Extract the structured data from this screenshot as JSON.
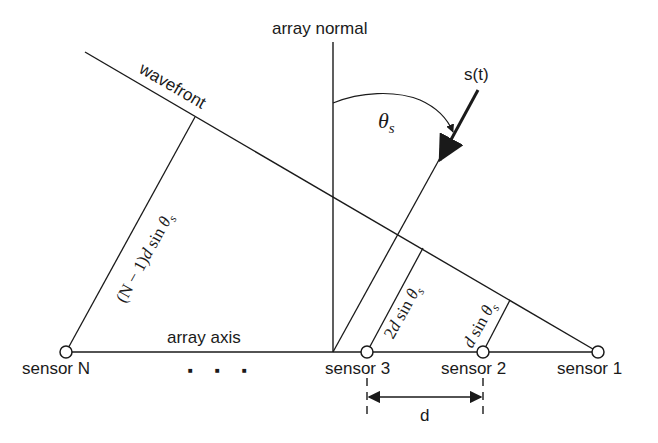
{
  "labels": {
    "array_normal": "array normal",
    "wavefront": "wavefront",
    "signal": "s(t)",
    "theta": "θ",
    "theta_sub": "s",
    "array_axis": "array axis",
    "ellipsis": "■ ■ ■",
    "spacing": "d"
  },
  "sensors": [
    {
      "label": "sensor N",
      "x": 66
    },
    {
      "label": "sensor 3",
      "x": 367
    },
    {
      "label": "sensor 2",
      "x": 483
    },
    {
      "label": "sensor 1",
      "x": 598
    }
  ],
  "path_labels": {
    "n_minus_1": {
      "pre": "(N − 1)",
      "d": "d",
      "sin": " sin ",
      "theta": "θ",
      "sub": "s"
    },
    "two_d": {
      "pre": "2",
      "d": "d",
      "sin": " sin ",
      "theta": "θ",
      "sub": "s"
    },
    "one_d": {
      "pre": "",
      "d": "d",
      "sin": " sin ",
      "theta": "θ",
      "sub": "s"
    }
  },
  "colors": {
    "stroke": "#1a1a1a",
    "background": "#ffffff"
  }
}
